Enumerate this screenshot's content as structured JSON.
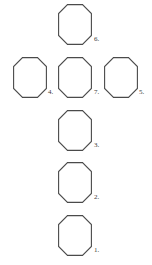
{
  "page": {
    "background_color": "#ffffff",
    "stroke_color": "#4a4a4a",
    "label_color": "#3a3a3a",
    "width": 152,
    "height": 265
  },
  "shapes": [
    {
      "id": "shape-6",
      "label": "6.",
      "shape_name": "octagon",
      "x": 58,
      "y": 4,
      "width": 34,
      "height": 41,
      "label_x": 94,
      "label_y": 36
    },
    {
      "id": "shape-4",
      "label": "4.",
      "shape_name": "octagon",
      "x": 13,
      "y": 57,
      "width": 34,
      "height": 41,
      "label_x": 48,
      "label_y": 89
    },
    {
      "id": "shape-7",
      "label": "7.",
      "shape_name": "octagon",
      "x": 58,
      "y": 57,
      "width": 34,
      "height": 41,
      "label_x": 94,
      "label_y": 89
    },
    {
      "id": "shape-5",
      "label": "5.",
      "shape_name": "octagon",
      "x": 104,
      "y": 57,
      "width": 34,
      "height": 41,
      "label_x": 139,
      "label_y": 89
    },
    {
      "id": "shape-3",
      "label": "3.",
      "shape_name": "octagon",
      "x": 58,
      "y": 110,
      "width": 34,
      "height": 41,
      "label_x": 94,
      "label_y": 142
    },
    {
      "id": "shape-2",
      "label": "2.",
      "shape_name": "octagon",
      "x": 58,
      "y": 162,
      "width": 34,
      "height": 41,
      "label_x": 94,
      "label_y": 194
    },
    {
      "id": "shape-1",
      "label": "1.",
      "shape_name": "octagon",
      "x": 58,
      "y": 215,
      "width": 34,
      "height": 41,
      "label_x": 94,
      "label_y": 247
    }
  ]
}
